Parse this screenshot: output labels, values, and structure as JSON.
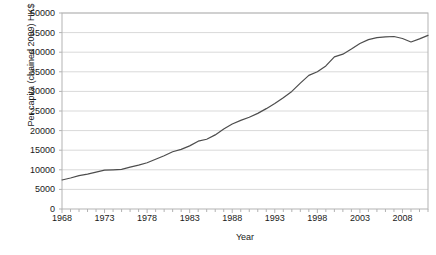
{
  "chart_data": {
    "type": "line",
    "title": "",
    "xlabel": "Year",
    "ylabel": "Per capita (chained 2009) HK$",
    "xlim": [
      1968,
      2011
    ],
    "ylim": [
      0,
      50000
    ],
    "grid": true,
    "legend": false,
    "legend_position": "none",
    "y_ticks": [
      50000,
      45000,
      40000,
      35000,
      30000,
      25000,
      20000,
      15000,
      10000,
      5000,
      0
    ],
    "x_ticks": [
      1968,
      1973,
      1978,
      1983,
      1988,
      1993,
      1998,
      2003,
      2008
    ],
    "x_minor_tick_step": 1,
    "series": [
      {
        "name": "Per capita GDP",
        "color": "#4d4d4d",
        "x": [
          1968,
          1969,
          1970,
          1971,
          1972,
          1973,
          1974,
          1975,
          1976,
          1977,
          1978,
          1979,
          1980,
          1981,
          1982,
          1983,
          1984,
          1985,
          1986,
          1987,
          1988,
          1989,
          1990,
          1991,
          1992,
          1993,
          1994,
          1995,
          1996,
          1997,
          1998,
          1999,
          2000,
          2001,
          2002,
          2003,
          2004,
          2005,
          2006,
          2007,
          2008,
          2009,
          2010,
          2011
        ],
        "values": [
          7400,
          7900,
          8500,
          8900,
          9400,
          9900,
          10000,
          10100,
          10700,
          11200,
          11800,
          12700,
          13600,
          14600,
          15200,
          16100,
          17300,
          17800,
          18900,
          20400,
          21700,
          22600,
          23400,
          24400,
          25600,
          26900,
          28400,
          30000,
          32100,
          34100,
          35000,
          36500,
          38800,
          39500,
          40800,
          42200,
          43200,
          43700,
          43900,
          44000,
          43500,
          42600,
          43400,
          44300
        ]
      }
    ]
  },
  "axis": {
    "y_tick_labels": [
      "50000",
      "45000",
      "40000",
      "35000",
      "30000",
      "25000",
      "20000",
      "15000",
      "10000",
      "5000",
      "0"
    ],
    "x_tick_labels": [
      "1968",
      "1973",
      "1978",
      "1983",
      "1988",
      "1993",
      "1998",
      "2003",
      "2008"
    ],
    "y_title": "Per capita (chained 2009) HK$",
    "x_title": "Year"
  },
  "cropped_header": {
    "text": ""
  },
  "colors": {
    "line": "#4d4d4d",
    "grid": "#d9d9d9",
    "frame": "#b3b3b3",
    "text": "#1a1a1a",
    "background": "#ffffff"
  }
}
